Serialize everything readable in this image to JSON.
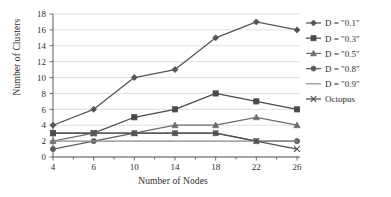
{
  "chart_data": {
    "type": "line",
    "title": "",
    "xlabel": "Number of Nodes",
    "ylabel": "Number of Clusters",
    "categories": [
      4,
      6,
      10,
      14,
      18,
      22,
      26
    ],
    "x_tick_labels": [
      "4",
      "6",
      "10",
      "14",
      "18",
      "22",
      "26"
    ],
    "y_tick_labels": [
      "0",
      "2",
      "4",
      "6",
      "8",
      "10",
      "12",
      "14",
      "16",
      "18"
    ],
    "ylim": [
      0,
      18
    ],
    "y_tick_step": 2,
    "grid": "horizontal",
    "legend_position": "right",
    "series": [
      {
        "name": "D = \"0.1\"",
        "marker": "diamond",
        "color": "#555555",
        "values": [
          4,
          6,
          10,
          11,
          15,
          17,
          16
        ]
      },
      {
        "name": "D = \"0.3\"",
        "marker": "square",
        "color": "#4a4a4a",
        "values": [
          3,
          3,
          5,
          6,
          8,
          7,
          6
        ]
      },
      {
        "name": "D = \"0.5\"",
        "marker": "triangle",
        "color": "#6e6e6e",
        "values": [
          2,
          3,
          3,
          4,
          4,
          5,
          4
        ]
      },
      {
        "name": "D = \"0.8\"",
        "marker": "circle",
        "color": "#5f5f5f",
        "values": [
          1,
          2,
          3,
          3,
          3,
          2,
          2
        ]
      },
      {
        "name": "D = \"0.9\"",
        "marker": "none",
        "color": "#909090",
        "values": [
          2,
          2,
          2,
          2,
          2,
          2,
          2
        ]
      },
      {
        "name": "Octopus",
        "marker": "cross",
        "color": "#4f4f4f",
        "values": [
          3,
          3,
          3,
          3,
          3,
          2,
          1
        ]
      }
    ]
  },
  "legend": {
    "entries": [
      "D = \"0.1\"",
      "D = \"0.3\"",
      "D = \"0.5\"",
      "D = \"0.8\"",
      "D = \"0.9\"",
      "Octopus"
    ]
  }
}
